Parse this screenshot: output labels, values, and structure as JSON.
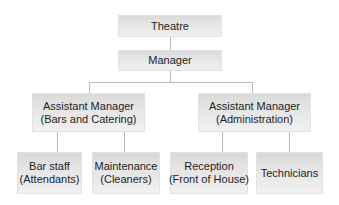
{
  "diagram": {
    "type": "org-chart",
    "nodes": {
      "theatre": {
        "line1": "Theatre"
      },
      "manager": {
        "line1": "Manager"
      },
      "asst_bars": {
        "line1": "Assistant Manager",
        "line2": "(Bars and Catering)"
      },
      "asst_admin": {
        "line1": "Assistant Manager",
        "line2": "(Administration)"
      },
      "bar_staff": {
        "line1": "Bar staff",
        "line2": "(Attendants)"
      },
      "maintenance": {
        "line1": "Maintenance",
        "line2": "(Cleaners)"
      },
      "reception": {
        "line1": "Reception",
        "line2": "(Front of House)"
      },
      "technicians": {
        "line1": "Technicians"
      }
    },
    "edges": [
      [
        "Theatre",
        "Manager"
      ],
      [
        "Manager",
        "Assistant Manager (Bars and Catering)"
      ],
      [
        "Manager",
        "Assistant Manager (Administration)"
      ],
      [
        "Assistant Manager (Bars and Catering)",
        "Bar staff (Attendants)"
      ],
      [
        "Assistant Manager (Bars and Catering)",
        "Maintenance (Cleaners)"
      ],
      [
        "Assistant Manager (Administration)",
        "Reception (Front of House)"
      ],
      [
        "Assistant Manager (Administration)",
        "Technicians"
      ]
    ]
  }
}
